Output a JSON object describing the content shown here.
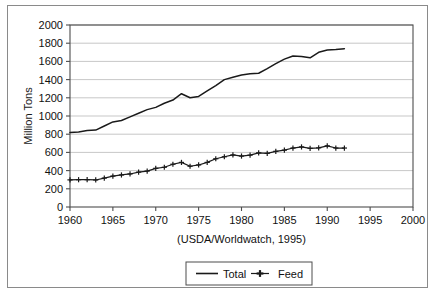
{
  "chart_data": {
    "type": "line",
    "title": "",
    "subtitle": "",
    "xlabel": "(USDA/Worldwatch, 1995)",
    "ylabel": "Million Tons",
    "xlim": [
      1960,
      2000
    ],
    "ylim": [
      0,
      2000
    ],
    "xticks": [
      1960,
      1965,
      1970,
      1975,
      1980,
      1985,
      1990,
      1995,
      2000
    ],
    "yticks": [
      0,
      200,
      400,
      600,
      800,
      1000,
      1200,
      1400,
      1600,
      1800,
      2000
    ],
    "grid": "horizontal",
    "legend_position": "bottom-center",
    "x": [
      1960,
      1961,
      1962,
      1963,
      1964,
      1965,
      1966,
      1967,
      1968,
      1969,
      1970,
      1971,
      1972,
      1973,
      1974,
      1975,
      1976,
      1977,
      1978,
      1979,
      1980,
      1981,
      1982,
      1983,
      1984,
      1985,
      1986,
      1987,
      1988,
      1989,
      1990,
      1991,
      1992
    ],
    "series": [
      {
        "name": "Total",
        "marker": "none",
        "values": [
          820,
          825,
          840,
          845,
          890,
          935,
          950,
          990,
          1030,
          1070,
          1095,
          1140,
          1175,
          1245,
          1200,
          1215,
          1275,
          1335,
          1400,
          1425,
          1450,
          1465,
          1470,
          1520,
          1575,
          1625,
          1660,
          1655,
          1640,
          1700,
          1725,
          1730,
          1740
        ]
      },
      {
        "name": "Feed",
        "marker": "plus",
        "values": [
          298,
          300,
          300,
          297,
          318,
          340,
          352,
          363,
          383,
          395,
          425,
          437,
          470,
          490,
          448,
          462,
          490,
          530,
          552,
          572,
          560,
          570,
          595,
          590,
          612,
          625,
          648,
          660,
          645,
          650,
          672,
          648,
          648
        ]
      }
    ]
  },
  "legend": {
    "entries": [
      {
        "label": "Total",
        "marker": "line"
      },
      {
        "label": "Feed",
        "marker": "plus"
      }
    ]
  },
  "colors": {
    "series_total": "#1a1a1a",
    "series_feed": "#1a1a1a",
    "grid": "#b9b9b9",
    "axis": "#4d4d4d",
    "border": "#8a8a8a",
    "background": "#ffffff"
  }
}
